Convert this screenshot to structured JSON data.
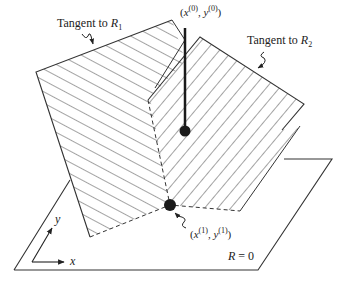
{
  "diagram": {
    "labels": {
      "tangent_r1": {
        "prefix": "Tangent to ",
        "var": "R",
        "sub": "1"
      },
      "tangent_r2": {
        "prefix": "Tangent to ",
        "var": "R",
        "sub": "2"
      },
      "point0": {
        "x": "x",
        "xsup": "(0)",
        "y": "y",
        "ysup": "(0)"
      },
      "point1": {
        "x": "x",
        "xsup": "(1)",
        "y": "y",
        "ysup": "(1)"
      },
      "plane": {
        "var": "R",
        "rest": " = 0"
      },
      "axis_x": "x",
      "axis_y": "y"
    },
    "colors": {
      "line": "#222222",
      "point": "#1a1a1a",
      "bg": "#ffffff"
    }
  }
}
